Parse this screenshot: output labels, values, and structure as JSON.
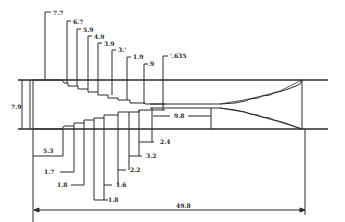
{
  "diagram": {
    "type": "engineering-dimension-drawing",
    "colors": {
      "background": "#ffffff",
      "ink": "#2a2a2a"
    },
    "top_labels": [
      {
        "id": "d1",
        "text": "7.7"
      },
      {
        "id": "d2",
        "text": "6.7"
      },
      {
        "id": "d3",
        "text": "5.9"
      },
      {
        "id": "d4",
        "text": "4.9"
      },
      {
        "id": "d5",
        "text": "3.9"
      },
      {
        "id": "d6",
        "text": "3.'"
      },
      {
        "id": "d7",
        "text": "1.9"
      },
      {
        "id": "d8",
        "text": ".9"
      },
      {
        "id": "d9",
        "text": "'.635"
      }
    ],
    "left_label": {
      "text": "7.9"
    },
    "bottom_labels": [
      {
        "id": "l1",
        "text": "5.3"
      },
      {
        "id": "l2",
        "text": "1.7"
      },
      {
        "id": "l3",
        "text": "1.8"
      },
      {
        "id": "l4",
        "text": "1.8"
      },
      {
        "id": "l5",
        "text": "1.6"
      },
      {
        "id": "l6",
        "text": "2.2"
      },
      {
        "id": "l7",
        "text": "3.2"
      },
      {
        "id": "l8",
        "text": "2.4"
      }
    ],
    "center_label": {
      "text": "9.8"
    },
    "overall_label": {
      "text": "49.8"
    }
  }
}
